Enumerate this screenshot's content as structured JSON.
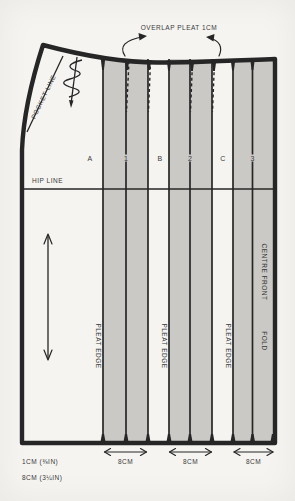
{
  "note": {
    "text": "OVERLAP PLEAT 1CM"
  },
  "pocket": {
    "label": "POCKET LINE"
  },
  "hip": {
    "label": "HIP LINE"
  },
  "sections": [
    {
      "label": "A"
    },
    {
      "label": "1"
    },
    {
      "label": "B"
    },
    {
      "label": "2"
    },
    {
      "label": "C"
    },
    {
      "label": "3"
    }
  ],
  "pleat_edges": [
    {
      "label": "PLEAT EDGE"
    },
    {
      "label": "PLEAT EDGE"
    },
    {
      "label": "PLEAT EDGE"
    }
  ],
  "centre_front": {
    "label": "CENTRE FRONT",
    "fold": "FOLD"
  },
  "measurements": [
    {
      "label": "8CM"
    },
    {
      "label": "8CM"
    },
    {
      "label": "8CM"
    }
  ],
  "legend": [
    {
      "text": "1CM (⅜IN)"
    },
    {
      "text": "8CM (3¼IN)"
    }
  ],
  "colors": {
    "paper": "#f5f4f1",
    "band": "#cac9c5",
    "line": "#262626",
    "ink": "#3a3a3a"
  }
}
